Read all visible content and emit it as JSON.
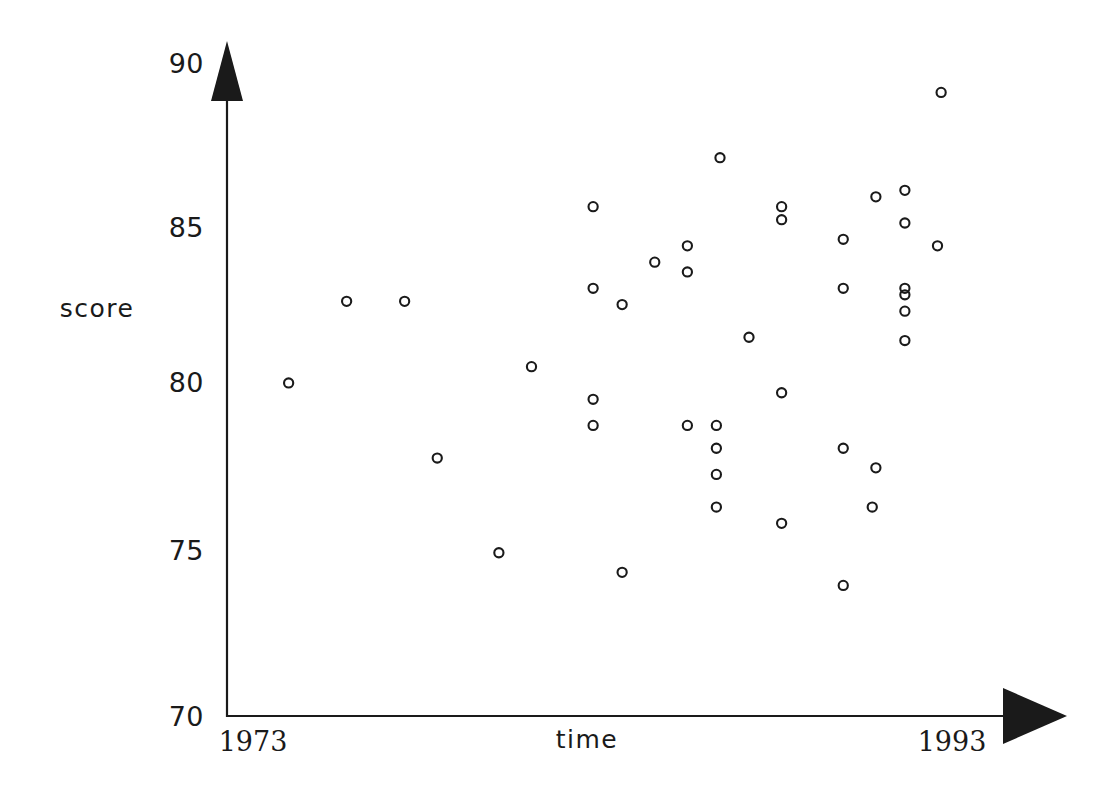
{
  "figure": {
    "background_color": "#ffffff",
    "ink_color": "#1a1a1a",
    "width": 1113,
    "height": 794
  },
  "axes": {
    "y_title": "score",
    "x_title": "time",
    "y_tick_labels": [
      "90",
      "85",
      "80",
      "75",
      "70"
    ],
    "x_start_label": "1973",
    "x_end_label": "1993",
    "y_arrowhead": "up-arrow",
    "x_arrowhead": "right-arrow"
  },
  "chart_data": {
    "type": "scatter",
    "title": "",
    "xlabel": "time",
    "ylabel": "score",
    "xlim": [
      1973,
      1993
    ],
    "ylim": [
      70,
      90
    ],
    "xticks": [
      1973,
      1993
    ],
    "xticklabels": [
      "1973",
      "1993"
    ],
    "yticks": [
      70,
      75,
      80,
      85,
      90
    ],
    "yticklabels": [
      "70",
      "75",
      "80",
      "85",
      "90"
    ],
    "grid": false,
    "legend": null,
    "marker": "open-circle",
    "marker_size": 8,
    "n_points": 41,
    "x": [
      1974.7,
      1976.3,
      1977.9,
      1978.8,
      1980.5,
      1981.4,
      1983.1,
      1983.1,
      1983.1,
      1983.1,
      1983.9,
      1983.9,
      1984.8,
      1985.7,
      1985.7,
      1985.7,
      1986.5,
      1986.5,
      1986.5,
      1986.5,
      1986.6,
      1987.4,
      1988.3,
      1988.3,
      1988.3,
      1988.3,
      1990.0,
      1990.0,
      1990.0,
      1990.0,
      1990.9,
      1990.8,
      1990.9,
      1991.7,
      1991.7,
      1991.7,
      1991.7,
      1991.7,
      1991.7,
      1992.6,
      1992.7
    ],
    "y": [
      80.2,
      82.7,
      82.7,
      77.9,
      75.0,
      80.7,
      85.6,
      83.1,
      79.7,
      78.9,
      82.6,
      74.4,
      83.9,
      84.4,
      83.6,
      78.9,
      78.9,
      78.2,
      77.4,
      76.4,
      87.1,
      81.6,
      85.6,
      85.2,
      79.9,
      75.9,
      84.6,
      83.1,
      78.2,
      74.0,
      77.6,
      76.4,
      85.9,
      86.1,
      85.1,
      83.1,
      82.9,
      82.4,
      81.5,
      84.4,
      89.1
    ]
  },
  "geometry": {
    "origin_px": {
      "x": 227,
      "y": 716
    },
    "x_end_px": 952,
    "y_top_px": 63,
    "px_per_year": 36.25,
    "px_per_score": 32.65
  }
}
